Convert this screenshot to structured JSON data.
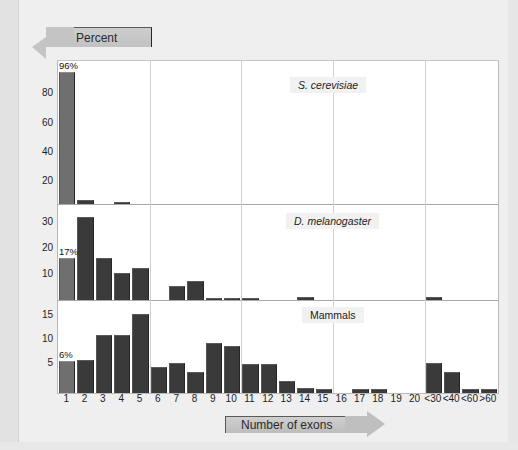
{
  "figure": {
    "background_color": "#efefef",
    "y_axis_banner": "Percent",
    "x_axis_banner": "Number of exons"
  },
  "chart_data": {
    "type": "bar",
    "title": "",
    "subtitle": "",
    "xlabel": "Number of exons",
    "ylabel": "Percent",
    "grid": true,
    "legend_position": "none",
    "categories": [
      "1",
      "2",
      "3",
      "4",
      "5",
      "6",
      "7",
      "8",
      "9",
      "10",
      "11",
      "12",
      "13",
      "14",
      "15",
      "16",
      "17",
      "18",
      "19",
      "20",
      "<30",
      "<40",
      "<60",
      ">60"
    ],
    "panels": [
      {
        "name": "S. cerevisiae",
        "italic": true,
        "yticks": [
          20,
          40,
          60,
          80
        ],
        "ylim": [
          0,
          100
        ],
        "annotation": "96%",
        "annotation_category": "1",
        "values": [
          96,
          3,
          0,
          1,
          0,
          0,
          0,
          0,
          0,
          0,
          0,
          0,
          0,
          0,
          0,
          0,
          0,
          0,
          0,
          0,
          0,
          0,
          0,
          0
        ]
      },
      {
        "name": "D. melanogaster",
        "italic": true,
        "yticks": [
          10,
          20,
          30
        ],
        "ylim": [
          0,
          37
        ],
        "annotation": "17%",
        "annotation_category": "1",
        "values": [
          17,
          33,
          17,
          11,
          13,
          0,
          6,
          8,
          1.2,
          1.2,
          1.2,
          0,
          0,
          1.5,
          0,
          0,
          0,
          0,
          0,
          0,
          1.5,
          0,
          0,
          0
        ]
      },
      {
        "name": "Mammals",
        "italic": false,
        "yticks": [
          5,
          10,
          15
        ],
        "ylim": [
          0,
          17
        ],
        "annotation": "6%",
        "annotation_category": "1",
        "values": [
          6,
          6.3,
          11,
          11,
          15,
          5,
          5.7,
          4,
          9.5,
          8.8,
          5.5,
          5.5,
          2.3,
          0.9,
          0.8,
          0,
          0.8,
          0.7,
          0,
          0,
          5.7,
          4,
          0.7,
          0.7
        ]
      }
    ]
  },
  "axis": {
    "ytick_labels_panel_0": [
      "80",
      "60",
      "40",
      "20"
    ],
    "ytick_labels_panel_1": [
      "30",
      "20",
      "10"
    ],
    "ytick_labels_panel_2": [
      "15",
      "10",
      "5"
    ]
  }
}
